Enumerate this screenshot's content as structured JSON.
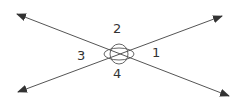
{
  "diagram": {
    "type": "intersecting-lines",
    "line_color": "#444444",
    "lines": [
      {
        "name": "line-a",
        "x1": 17,
        "y1": 14,
        "x2": 229,
        "y2": 96,
        "arrows": "both"
      },
      {
        "name": "line-b",
        "x1": 18,
        "y1": 92,
        "x2": 222,
        "y2": 16,
        "arrows": "both"
      }
    ],
    "intersection": {
      "x": 119,
      "y": 54
    },
    "angle_labels": [
      {
        "id": "1",
        "text": "1",
        "x": 152,
        "y": 57
      },
      {
        "id": "2",
        "text": "2",
        "x": 117,
        "y": 33
      },
      {
        "id": "3",
        "text": "3",
        "x": 81,
        "y": 60
      },
      {
        "id": "4",
        "text": "4",
        "x": 117,
        "y": 78
      }
    ]
  }
}
